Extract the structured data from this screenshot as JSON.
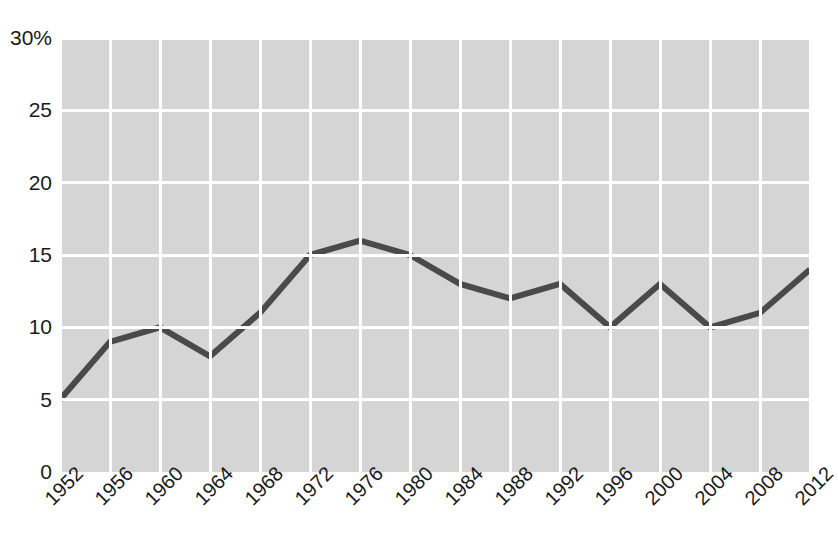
{
  "chart_data": {
    "type": "line",
    "title": "",
    "subtitle": "",
    "xlabel": "",
    "ylabel": "",
    "categories": [
      "1952",
      "1956",
      "1960",
      "1964",
      "1968",
      "1972",
      "1976",
      "1980",
      "1984",
      "1988",
      "1992",
      "1996",
      "2000",
      "2004",
      "2008",
      "2012"
    ],
    "values": [
      5,
      9,
      10,
      8,
      11,
      15,
      16,
      15,
      13,
      12,
      13,
      10,
      13,
      10,
      11,
      14
    ],
    "series": [
      {
        "name": "",
        "values": [
          5,
          9,
          10,
          8,
          11,
          15,
          16,
          15,
          13,
          12,
          13,
          10,
          13,
          10,
          11,
          14
        ]
      }
    ],
    "ylim": [
      0,
      30
    ],
    "yticks": [
      0,
      5,
      10,
      15,
      20,
      25,
      30
    ],
    "ytick_labels": [
      "0",
      "5",
      "10",
      "15",
      "20",
      "25",
      "30%"
    ],
    "xtick_labels": [
      "1952",
      "1956",
      "1960",
      "1964",
      "1968",
      "1972",
      "1976",
      "1980",
      "1984",
      "1988",
      "1992",
      "1996",
      "2000",
      "2004",
      "2008",
      "2012"
    ],
    "grid": true,
    "legend": null,
    "legend_position": "none",
    "annotations": []
  },
  "style": {
    "plot_background": "#d5d5d5",
    "gridline_color": "#ffffff",
    "line_color": "#4a4a4a",
    "text_color": "#1a1a1a",
    "page_background": "#ffffff",
    "line_width": 6
  }
}
